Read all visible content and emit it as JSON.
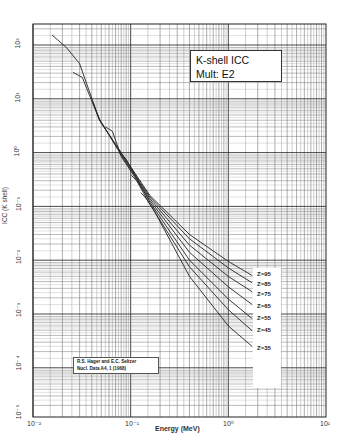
{
  "chart_data": {
    "type": "line",
    "title": "K-shell ICC",
    "subtitle": "Mult: E2",
    "xlabel": "Energy (MeV)",
    "ylabel": "ICC (K shell)",
    "xscale": "log",
    "yscale": "log",
    "xlim": [
      0.01,
      10
    ],
    "ylim": [
      1e-05,
      250
    ],
    "grid": true,
    "x_ticks": [
      "10^-2",
      "10^-1",
      "10^0",
      "10^1"
    ],
    "y_ticks": [
      "10^-5",
      "10^-4",
      "10^-3",
      "10^-2",
      "10^-1",
      "10^0",
      "10^1",
      "10^2"
    ],
    "annotation": "R.S. Hager and E.C. Seltzer, Nucl. Data A4, 1 (1968)",
    "series": [
      {
        "name": "Z=95",
        "x": [
          0.0156,
          0.022,
          0.03,
          0.048,
          0.08,
          0.157,
          0.4,
          1.0,
          1.75
        ],
        "y": [
          154,
          90,
          45,
          4.0,
          1.0,
          0.16,
          0.03,
          0.0095,
          0.0052
        ]
      },
      {
        "name": "Z=85",
        "x": [
          0.0257,
          0.032,
          0.048,
          0.08,
          0.157,
          0.4,
          1.0,
          1.75
        ],
        "y": [
          31,
          25,
          4.0,
          0.95,
          0.15,
          0.025,
          0.0072,
          0.0038
        ]
      },
      {
        "name": "Z=75",
        "x": [
          0.041,
          0.048,
          0.08,
          0.157,
          0.4,
          1.0,
          1.75
        ],
        "y": [
          8.7,
          4.2,
          0.9,
          0.14,
          0.019,
          0.005,
          0.0026
        ]
      },
      {
        "name": "Z=65",
        "x": [
          0.055,
          0.065,
          0.08,
          0.157,
          0.4,
          1.0,
          1.75
        ],
        "y": [
          3.0,
          2.5,
          0.85,
          0.13,
          0.014,
          0.0032,
          0.0015
        ]
      },
      {
        "name": "Z=55",
        "x": [
          0.076,
          0.09,
          0.157,
          0.4,
          1.0,
          1.75
        ],
        "y": [
          1.0,
          0.75,
          0.12,
          0.01,
          0.0019,
          0.00082
        ]
      },
      {
        "name": "Z=45",
        "x": [
          0.101,
          0.115,
          0.157,
          0.4,
          1.0,
          1.75
        ],
        "y": [
          0.38,
          0.3,
          0.11,
          0.0075,
          0.0012,
          0.00049
        ]
      },
      {
        "name": "Z=35",
        "x": [
          0.127,
          0.14,
          0.17,
          0.4,
          1.0,
          1.75
        ],
        "y": [
          0.18,
          0.15,
          0.09,
          0.005,
          0.0006,
          0.00025
        ]
      }
    ]
  },
  "title_box": {
    "line1": "K-shell ICC",
    "line2": "Mult: E2"
  },
  "citation": {
    "line1": "R.S. Hager and E.C. Seltzer",
    "line2": "Nucl. Data A4, 1 (1968)"
  },
  "axes": {
    "xlabel": "Energy (MeV)",
    "ylabel": "ICC (K shell)",
    "x_tick_labels": [
      "10⁻²",
      "10⁻¹",
      "10⁰",
      "10¹"
    ],
    "y_tick_labels": [
      "10²",
      "10¹",
      "10⁰",
      "10⁻¹",
      "10⁻²",
      "10⁻³",
      "10⁻⁴",
      "10⁻⁵"
    ]
  },
  "z_labels": [
    "Z=95",
    "Z=85",
    "Z=75",
    "Z=65",
    "Z=55",
    "Z=45",
    "Z=35"
  ]
}
